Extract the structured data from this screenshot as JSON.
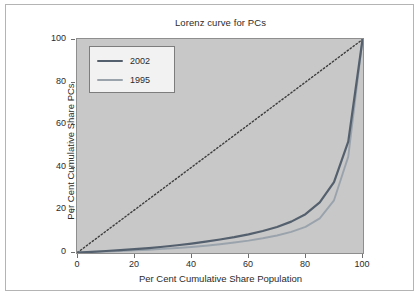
{
  "chart_data": {
    "type": "line",
    "title": "Lorenz curve for PCs",
    "xlabel": "Per Cent Cumulative Share Population",
    "ylabel": "Per Cent Cumulative Share PCs",
    "xlim": [
      0,
      100
    ],
    "ylim": [
      0,
      100
    ],
    "xticks": [
      "0",
      "20",
      "40",
      "60",
      "80",
      "100"
    ],
    "yticks": [
      "0",
      "20",
      "40",
      "60",
      "80",
      "100"
    ],
    "grid": false,
    "legend_position": "top-left",
    "colors": {
      "series_2002": "#54606e",
      "series_1995": "#9aa3ac",
      "equality_line": "#3c3c3c",
      "panel_background": "#c8c8c8",
      "panel_border": "#8e8e8e",
      "page_background": "#ffffff",
      "frame_border": "#b4b4b4",
      "text": "#2b2b2b"
    },
    "x": [
      0,
      5,
      10,
      15,
      20,
      25,
      30,
      35,
      40,
      45,
      50,
      55,
      60,
      65,
      70,
      75,
      80,
      85,
      90,
      95,
      100
    ],
    "series": [
      {
        "name": "2002",
        "color": "#54606e",
        "style": "solid",
        "values": [
          0,
          0.3,
          0.7,
          1.1,
          1.6,
          2.1,
          2.7,
          3.4,
          4.2,
          5.1,
          6.1,
          7.2,
          8.5,
          10.1,
          12.0,
          14.5,
          18.0,
          23.5,
          33.0,
          52.0,
          100
        ]
      },
      {
        "name": "1995",
        "color": "#9aa3ac",
        "style": "solid",
        "values": [
          0,
          0.2,
          0.4,
          0.7,
          1.0,
          1.3,
          1.7,
          2.1,
          2.6,
          3.2,
          3.9,
          4.7,
          5.6,
          6.7,
          8.0,
          9.7,
          12.0,
          16.0,
          24.5,
          45.0,
          100
        ]
      },
      {
        "name": "line of equality",
        "color": "#3c3c3c",
        "style": "dotted",
        "values": [
          0,
          5,
          10,
          15,
          20,
          25,
          30,
          35,
          40,
          45,
          50,
          55,
          60,
          65,
          70,
          75,
          80,
          85,
          90,
          95,
          100
        ]
      }
    ],
    "legend": [
      {
        "label": "2002",
        "color": "#54606e"
      },
      {
        "label": "1995",
        "color": "#9aa3ac"
      }
    ]
  }
}
